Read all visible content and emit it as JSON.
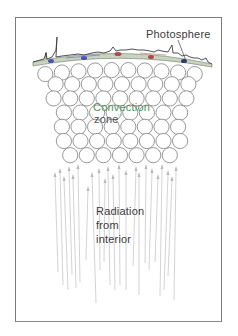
{
  "figure": {
    "labels": {
      "photosphere": "Photosphere",
      "convection_line1": "Convection",
      "convection_line2": "zone",
      "radiation_line1": "Radiation",
      "radiation_line2": "from",
      "radiation_line3": "interior"
    },
    "colors": {
      "frame": "#7a7a7a",
      "circle_stroke": "#8c8c8c",
      "arrow": "#c4c4c4",
      "photosphere_fill": "#c9d3c0",
      "photosphere_outline": "#3d3d3d",
      "convection_label": "#4f8f5a",
      "spot_red": "#b04a4a",
      "spot_blue": "#4a55b0",
      "spot_darkblue": "#2a3a6a"
    },
    "circle_rows": [
      10,
      9,
      9,
      8,
      8,
      8,
      7
    ]
  }
}
